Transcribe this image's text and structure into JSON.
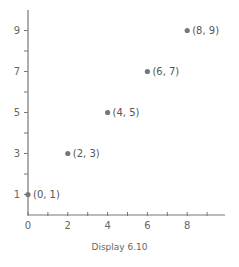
{
  "caption": "Display 6.10",
  "colors": {
    "axis": "#777777",
    "point": "#777777",
    "text": "#666666"
  },
  "chart_data": {
    "type": "scatter",
    "title": "",
    "xlabel": "",
    "ylabel": "",
    "xlim": [
      0,
      9.5
    ],
    "ylim": [
      0,
      10
    ],
    "grid": false,
    "x_ticks_labeled": [
      0,
      2,
      4,
      6,
      8
    ],
    "x_ticks_minor": [
      1,
      3,
      5,
      7,
      9
    ],
    "y_ticks_labeled": [
      1,
      3,
      5,
      7,
      9
    ],
    "y_ticks_minor": [
      2,
      4,
      6,
      8
    ],
    "points": [
      {
        "x": 0,
        "y": 1,
        "label": "(0, 1)"
      },
      {
        "x": 2,
        "y": 3,
        "label": "(2, 3)"
      },
      {
        "x": 4,
        "y": 5,
        "label": "(4, 5)"
      },
      {
        "x": 6,
        "y": 7,
        "label": "(6, 7)"
      },
      {
        "x": 8,
        "y": 9,
        "label": "(8, 9)"
      }
    ],
    "caption": "Display 6.10"
  }
}
